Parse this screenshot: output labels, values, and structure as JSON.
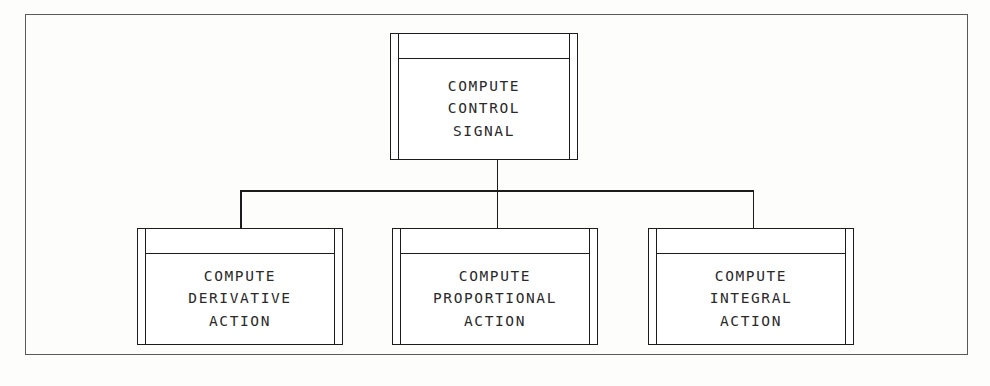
{
  "diagram": {
    "type": "structure-chart",
    "notation": "library-module",
    "title_text": "",
    "background_color": "#fdfdfc",
    "line_color": "#1c1c1c",
    "frame_color": "#5a5a5a",
    "text_color": "#2a2a2a"
  },
  "frame": {
    "name": "diagram-border"
  },
  "parent": {
    "id": "compute-control-signal",
    "lines": [
      "COMPUTE",
      "CONTROL",
      "SIGNAL"
    ],
    "line1": "COMPUTE",
    "line2": "CONTROL",
    "line3": "SIGNAL"
  },
  "children": [
    {
      "id": "compute-derivative-action",
      "lines": [
        "COMPUTE",
        "DERIVATIVE",
        "ACTION"
      ],
      "line1": "COMPUTE",
      "line2": "DERIVATIVE",
      "line3": "ACTION"
    },
    {
      "id": "compute-proportional-action",
      "lines": [
        "COMPUTE",
        "PROPORTIONAL",
        "ACTION"
      ],
      "line1": "COMPUTE",
      "line2": "PROPORTIONAL",
      "line3": "ACTION"
    },
    {
      "id": "compute-integral-action",
      "lines": [
        "COMPUTE",
        "INTEGRAL",
        "ACTION"
      ],
      "line1": "COMPUTE",
      "line2": "INTEGRAL",
      "line3": "ACTION"
    }
  ]
}
